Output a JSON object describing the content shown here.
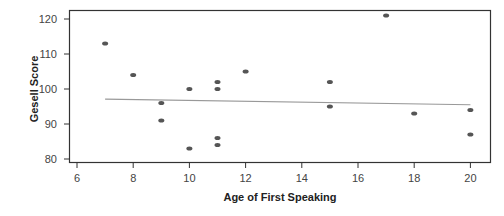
{
  "chart_data": {
    "type": "scatter",
    "title": "",
    "xlabel": "Age of First Speaking",
    "ylabel": "Gesell Score",
    "xlim": [
      5.7,
      20.7
    ],
    "ylim": [
      79,
      122.5
    ],
    "xticks": [
      6,
      8,
      10,
      12,
      14,
      16,
      18,
      20
    ],
    "yticks": [
      80,
      90,
      100,
      110,
      120
    ],
    "grid": false,
    "legend": null,
    "series": [
      {
        "name": "Observations",
        "color": "#555555",
        "points": [
          {
            "x": 7,
            "y": 113
          },
          {
            "x": 8,
            "y": 104
          },
          {
            "x": 9,
            "y": 96
          },
          {
            "x": 9,
            "y": 91
          },
          {
            "x": 10,
            "y": 100
          },
          {
            "x": 10,
            "y": 83
          },
          {
            "x": 11,
            "y": 102
          },
          {
            "x": 11,
            "y": 100
          },
          {
            "x": 11,
            "y": 86
          },
          {
            "x": 11,
            "y": 84
          },
          {
            "x": 12,
            "y": 105
          },
          {
            "x": 15,
            "y": 102
          },
          {
            "x": 15,
            "y": 95
          },
          {
            "x": 17,
            "y": 121
          },
          {
            "x": 18,
            "y": 93
          },
          {
            "x": 20,
            "y": 94
          },
          {
            "x": 20,
            "y": 87
          }
        ]
      }
    ],
    "regression_line": {
      "name": "Fitted line",
      "color": "#999999",
      "x": [
        7,
        20
      ],
      "y": [
        97.1,
        95.5
      ]
    }
  }
}
